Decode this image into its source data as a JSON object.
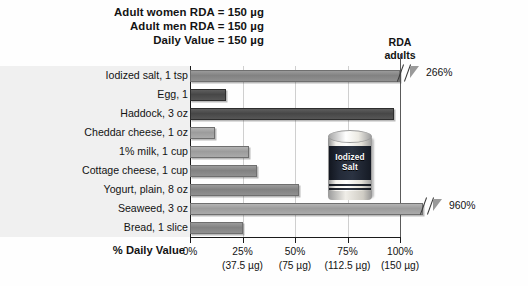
{
  "header": {
    "lines": [
      "Adult women RDA = 150 µg",
      "Adult men RDA = 150 µg",
      "Daily Value = 150 µg"
    ]
  },
  "callout": {
    "line1": "RDA",
    "line2": "adults"
  },
  "illustration": {
    "name": "iodized-salt-can",
    "label_line1": "Iodized",
    "label_line2": "Salt"
  },
  "axis": {
    "title": "% Daily Value",
    "ticks": [
      {
        "percent": "0%",
        "micrograms": ""
      },
      {
        "percent": "25%",
        "micrograms": "(37.5 µg)"
      },
      {
        "percent": "50%",
        "micrograms": "(75 µg)"
      },
      {
        "percent": "75%",
        "micrograms": "(112.5 µg)"
      },
      {
        "percent": "100%",
        "micrograms": "(150 µg)"
      }
    ]
  },
  "chart_data": {
    "type": "bar",
    "orientation": "horizontal",
    "title": "",
    "xlabel": "% Daily Value",
    "ylabel": "",
    "xlim": [
      0,
      100
    ],
    "grid": true,
    "nutrient": "Iodine",
    "daily_value": "150 µg",
    "rda_reference_line": 100,
    "categories": [
      "Iodized salt, 1 tsp",
      "Egg, 1",
      "Haddock, 3 oz",
      "Cheddar cheese, 1 oz",
      "1% milk, 1 cup",
      "Cottage cheese, 1 cup",
      "Yogurt, plain, 8 oz",
      "Seaweed, 3 oz",
      "Bread, 1 slice"
    ],
    "values": [
      266,
      17,
      97,
      12,
      28,
      32,
      52,
      960,
      25
    ],
    "bars": [
      {
        "label": "Iodized salt, 1 tsp",
        "value": 266,
        "truncated": true,
        "value_label": "266%",
        "shade": "mid"
      },
      {
        "label": "Egg, 1",
        "value": 17,
        "truncated": false,
        "value_label": "",
        "shade": "dark"
      },
      {
        "label": "Haddock, 3 oz",
        "value": 97,
        "truncated": false,
        "value_label": "",
        "shade": "dark"
      },
      {
        "label": "Cheddar cheese, 1 oz",
        "value": 12,
        "truncated": false,
        "value_label": "",
        "shade": "light"
      },
      {
        "label": "1% milk, 1 cup",
        "value": 28,
        "truncated": false,
        "value_label": "",
        "shade": "light"
      },
      {
        "label": "Cottage cheese, 1 cup",
        "value": 32,
        "truncated": false,
        "value_label": "",
        "shade": "mid"
      },
      {
        "label": "Yogurt, plain, 8 oz",
        "value": 52,
        "truncated": false,
        "value_label": "",
        "shade": "mid"
      },
      {
        "label": "Seaweed, 3 oz",
        "value": 960,
        "truncated": true,
        "value_label": "960%",
        "shade": "light"
      },
      {
        "label": "Bread, 1 slice",
        "value": 25,
        "truncated": false,
        "value_label": "",
        "shade": "mid"
      }
    ],
    "annotations": [
      "RDA adults"
    ]
  }
}
